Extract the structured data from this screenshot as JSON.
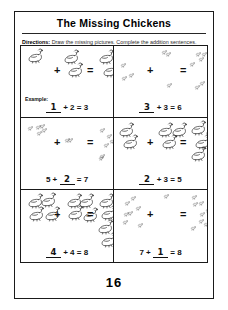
{
  "worksheet": {
    "title": "The Missing Chickens",
    "directions_label": "Directions:",
    "directions_text": " Draw the missing pictures. Complete the addition sentences.",
    "example_label": "Example:",
    "page_number": "16"
  },
  "problems": [
    {
      "id": "problem-1",
      "bird": "hen",
      "addend_a": 1,
      "addend_b": 2,
      "sum": 3,
      "missing": "addend_a",
      "answer": "1",
      "is_example": true,
      "equation": {
        "a": "1",
        "plus": "+",
        "b": "2",
        "equals": "=",
        "sum": "3"
      }
    },
    {
      "id": "problem-2",
      "bird": "chick",
      "addend_a": 3,
      "addend_b": 3,
      "sum": 6,
      "missing": "addend_a",
      "answer": "3",
      "is_example": false,
      "equation": {
        "a": "3",
        "plus": "+",
        "b": "3",
        "equals": "=",
        "sum": "6"
      }
    },
    {
      "id": "problem-3",
      "bird": "chick",
      "addend_a": 5,
      "addend_b": 2,
      "sum": 7,
      "missing": "addend_b",
      "answer": "2",
      "is_example": false,
      "equation": {
        "a": "5",
        "plus": "+",
        "b": "2",
        "equals": "=",
        "sum": "7"
      }
    },
    {
      "id": "problem-4",
      "bird": "hen",
      "addend_a": 2,
      "addend_b": 3,
      "sum": 5,
      "missing": "addend_a",
      "answer": "2",
      "is_example": false,
      "equation": {
        "a": "2",
        "plus": "+",
        "b": "3",
        "equals": "=",
        "sum": "5"
      }
    },
    {
      "id": "problem-5",
      "bird": "hen",
      "addend_a": 4,
      "addend_b": 4,
      "sum": 8,
      "missing": "addend_a",
      "answer": "4",
      "is_example": false,
      "equation": {
        "a": "4",
        "plus": "+",
        "b": "4",
        "equals": "=",
        "sum": "8"
      }
    },
    {
      "id": "problem-6",
      "bird": "chick",
      "addend_a": 7,
      "addend_b": 1,
      "sum": 8,
      "missing": "addend_b",
      "answer": "1",
      "is_example": false,
      "equation": {
        "a": "7",
        "plus": "+",
        "b": "1",
        "equals": "=",
        "sum": "8"
      }
    }
  ],
  "symbols": {
    "plus": "+",
    "equals": "="
  },
  "colors": {
    "ink": "#111111",
    "border": "#1a1a1a",
    "paper": "#ffffff"
  }
}
